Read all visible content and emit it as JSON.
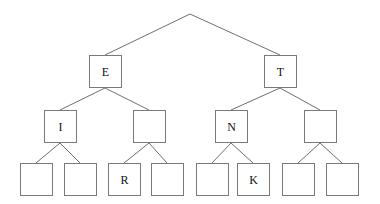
{
  "figure": {
    "kind": "binary-tree-diagram",
    "title": "",
    "background_color": "#ffffff",
    "box_border_color": "#7a7a7a",
    "box_fill_color": "#ffffff",
    "edge_color": "#6f6f6f",
    "text_color": "#111111",
    "box_size": 33,
    "depth_levels": 4,
    "root": {
      "x": 190,
      "y": 14,
      "label": ""
    },
    "levels": [
      {
        "index": 1,
        "y": 55,
        "nodes": [
          {
            "id": "n-e",
            "label": "E",
            "x": 89,
            "y": 55
          },
          {
            "id": "n-t",
            "label": "T",
            "x": 264,
            "y": 55
          }
        ]
      },
      {
        "index": 2,
        "y": 110,
        "nodes": [
          {
            "id": "n-i",
            "label": "I",
            "x": 44,
            "y": 110
          },
          {
            "id": "n-b2",
            "label": "",
            "x": 133,
            "y": 110
          },
          {
            "id": "n-n",
            "label": "N",
            "x": 215,
            "y": 110
          },
          {
            "id": "n-b4",
            "label": "",
            "x": 304,
            "y": 110
          }
        ]
      },
      {
        "index": 3,
        "y": 163,
        "nodes": [
          {
            "id": "n-l1",
            "label": "",
            "x": 20,
            "y": 163
          },
          {
            "id": "n-l2",
            "label": "",
            "x": 64,
            "y": 163
          },
          {
            "id": "n-l3",
            "label": "R",
            "x": 108,
            "y": 163
          },
          {
            "id": "n-l4",
            "label": "",
            "x": 151,
            "y": 163
          },
          {
            "id": "n-l5",
            "label": "",
            "x": 196,
            "y": 163
          },
          {
            "id": "n-l6",
            "label": "K",
            "x": 237,
            "y": 163
          },
          {
            "id": "n-l7",
            "label": "",
            "x": 282,
            "y": 163
          },
          {
            "id": "n-l8",
            "label": "",
            "x": 326,
            "y": 163
          }
        ]
      }
    ],
    "edges": [
      {
        "from": "root",
        "to": "n-e",
        "x1": 190,
        "y1": 14,
        "x2": 105,
        "y2": 55
      },
      {
        "from": "root",
        "to": "n-t",
        "x1": 190,
        "y1": 14,
        "x2": 280,
        "y2": 55
      },
      {
        "from": "n-e",
        "to": "n-i",
        "x1": 105,
        "y1": 88,
        "x2": 60,
        "y2": 110
      },
      {
        "from": "n-e",
        "to": "n-b2",
        "x1": 105,
        "y1": 88,
        "x2": 149,
        "y2": 110
      },
      {
        "from": "n-t",
        "to": "n-n",
        "x1": 280,
        "y1": 88,
        "x2": 231,
        "y2": 110
      },
      {
        "from": "n-t",
        "to": "n-b4",
        "x1": 280,
        "y1": 88,
        "x2": 320,
        "y2": 110
      },
      {
        "from": "n-i",
        "to": "n-l1",
        "x1": 60,
        "y1": 143,
        "x2": 36,
        "y2": 163
      },
      {
        "from": "n-i",
        "to": "n-l2",
        "x1": 60,
        "y1": 143,
        "x2": 80,
        "y2": 163
      },
      {
        "from": "n-b2",
        "to": "n-l3",
        "x1": 149,
        "y1": 143,
        "x2": 124,
        "y2": 163
      },
      {
        "from": "n-b2",
        "to": "n-l4",
        "x1": 149,
        "y1": 143,
        "x2": 167,
        "y2": 163
      },
      {
        "from": "n-n",
        "to": "n-l5",
        "x1": 231,
        "y1": 143,
        "x2": 212,
        "y2": 163
      },
      {
        "from": "n-n",
        "to": "n-l6",
        "x1": 231,
        "y1": 143,
        "x2": 253,
        "y2": 163
      },
      {
        "from": "n-b4",
        "to": "n-l7",
        "x1": 320,
        "y1": 143,
        "x2": 298,
        "y2": 163
      },
      {
        "from": "n-b4",
        "to": "n-l8",
        "x1": 320,
        "y1": 143,
        "x2": 342,
        "y2": 163
      }
    ],
    "labels_in_order": [
      "E",
      "T",
      "I",
      "N",
      "R",
      "K"
    ]
  }
}
